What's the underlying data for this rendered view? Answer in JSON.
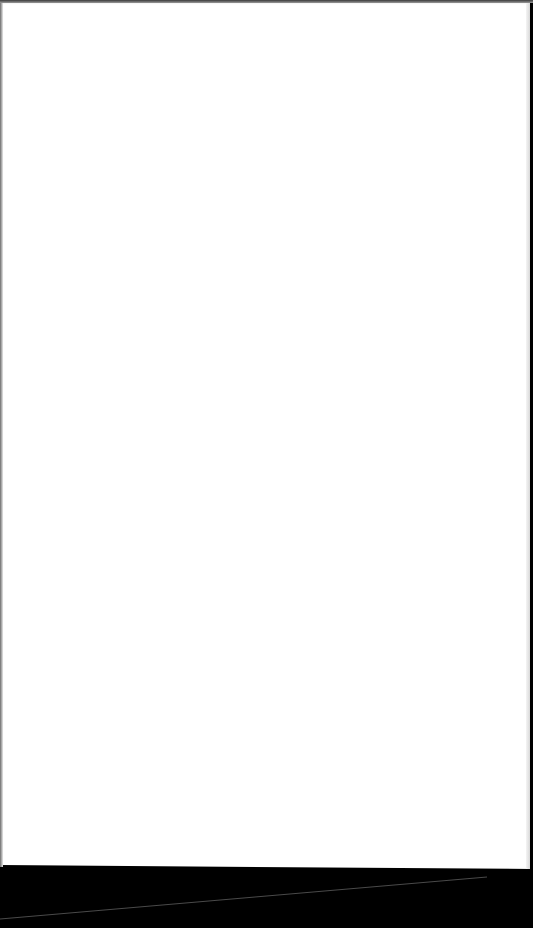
{
  "scene": {
    "description": "Blank white sheet of paper photographed on a black surface",
    "paper": {
      "color": "#ffffff",
      "text": ""
    },
    "background": {
      "color": "#000000"
    }
  }
}
